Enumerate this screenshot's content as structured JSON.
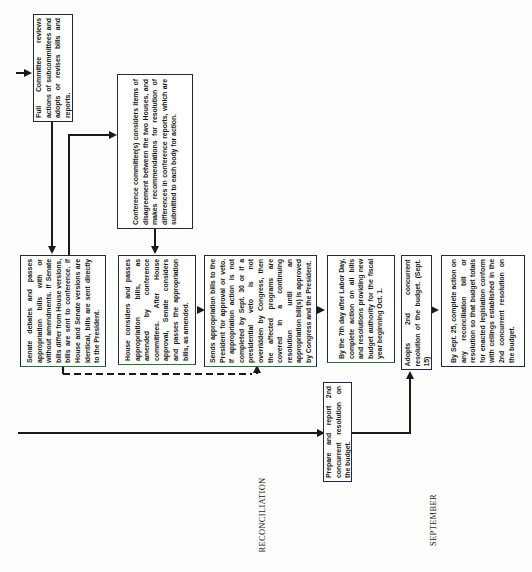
{
  "diagram": {
    "orientation": "rotated-90-ccw",
    "colors": {
      "line": "#1a1a1a",
      "box_border": "#1f2a44",
      "background": "#fdfdfb"
    },
    "nodes": {
      "full_committee": "Full Committee reviews actions of subcommittees and adopts or revises bills and reports.",
      "conference_committee": "Conference committee(s) considers items of disagreement between the two Houses, and makes recommendations for resolution of differences in conference reports, which are submitted to each body for action.",
      "senate_debates": "Senate debates and passes appropriation bills with or without amendments. If Senate bills differ from House versions, bills are sent to conference. If House and Senate versions are identical, bills are sent directly to the President.",
      "house_considers": "House considers and passes appropriation bills, as amended by conference committees. After House approval, Senate considers and passes the appropriation bills, as amended.",
      "sends_to_president": "Sends appropriation bills to the President for approval or veto. If appropriation action is not completed by Sept. 30 or if a presidential veto is not overridden by Congress, then the affected programs are covered in a continuing resolution until an appropriation bill(s) is approved by Congress and the President.",
      "labor_day": "By the 7th day after Labor Day, complete action on all bills and resolutions providing new budget authority for the fiscal year beginning Oct. 1.",
      "prepare_report": "Prepare and report 2nd concurrent resolution on the budget.",
      "adopts_2nd": "Adopts 2nd concurrent resolution of the budget. (Sept. 15)",
      "sept_25": "By Sept. 25, complete action on any reconciliation bill or resolution so that budget totals for enacted legislation conform with ceilings established in the 2nd concurrent resolution on the budget."
    },
    "phase_labels": {
      "reconciliation": "RECONCILIATION",
      "september": "SEPTEMBER"
    }
  }
}
